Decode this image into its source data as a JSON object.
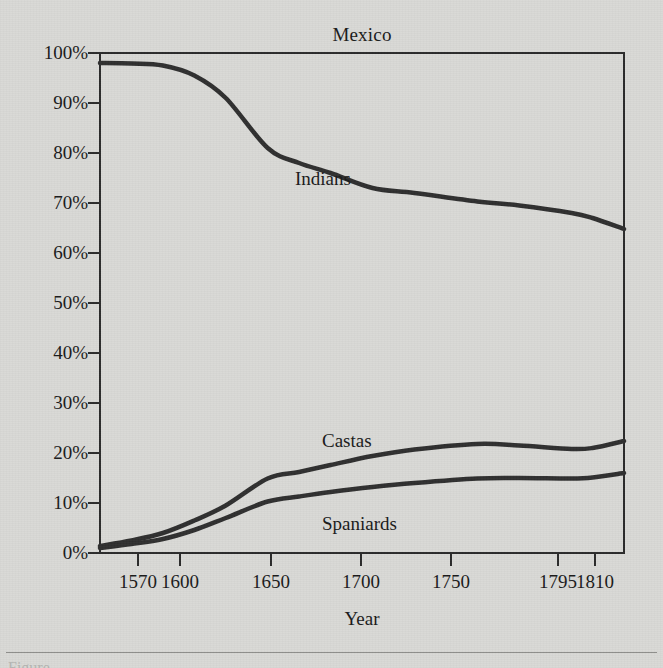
{
  "figure": {
    "background_color": "#d9d9d6",
    "ink_color": "#2b2b2b",
    "footer_partial_text": "Figure"
  },
  "chart_data": {
    "type": "line",
    "title": "Mexico",
    "xlabel": "Year",
    "ylabel": "",
    "xlim": [
      1570,
      1820
    ],
    "ylim": [
      0,
      100
    ],
    "grid": false,
    "legend_position": "inline-labels",
    "x_tick_labels": [
      "1570",
      "1600",
      "1650",
      "1700",
      "1750",
      "1795",
      "1810"
    ],
    "x_tick_values": [
      1570,
      1600,
      1650,
      1700,
      1750,
      1795,
      1810
    ],
    "x_tick_pixels": [
      138,
      180,
      271,
      361,
      451,
      558,
      595
    ],
    "y_tick_labels": [
      "0%",
      "10%",
      "20%",
      "30%",
      "40%",
      "50%",
      "60%",
      "70%",
      "80%",
      "90%",
      "100%"
    ],
    "y_tick_values": [
      0,
      10,
      20,
      30,
      40,
      50,
      60,
      70,
      80,
      90,
      100
    ],
    "series": [
      {
        "name": "Indians",
        "label_position": {
          "x": 295,
          "y": 168
        },
        "x": [
          1570,
          1585,
          1600,
          1615,
          1630,
          1650,
          1665,
          1680,
          1700,
          1720,
          1750,
          1770,
          1795,
          1805,
          1820
        ],
        "values": [
          98.0,
          97.9,
          97.5,
          95.5,
          91.0,
          81.0,
          78.0,
          76.0,
          73.0,
          72.0,
          70.3,
          69.5,
          68.0,
          67.0,
          64.8
        ]
      },
      {
        "name": "Castas",
        "label_position": {
          "x": 322,
          "y": 430
        },
        "x": [
          1570,
          1585,
          1600,
          1615,
          1630,
          1650,
          1665,
          1680,
          1700,
          1720,
          1750,
          1770,
          1795,
          1805,
          1820
        ],
        "values": [
          1.4,
          2.5,
          4.0,
          6.5,
          9.5,
          14.9,
          16.2,
          17.6,
          19.4,
          20.7,
          21.8,
          21.5,
          20.8,
          21.0,
          22.4
        ]
      },
      {
        "name": "Spaniards",
        "label_position": {
          "x": 322,
          "y": 513
        },
        "x": [
          1570,
          1585,
          1600,
          1615,
          1630,
          1650,
          1665,
          1680,
          1700,
          1720,
          1750,
          1770,
          1795,
          1805,
          1820
        ],
        "values": [
          1.0,
          1.8,
          2.8,
          4.6,
          7.0,
          10.3,
          11.3,
          12.2,
          13.2,
          14.0,
          14.9,
          15.0,
          14.9,
          15.1,
          16.0
        ]
      }
    ]
  }
}
